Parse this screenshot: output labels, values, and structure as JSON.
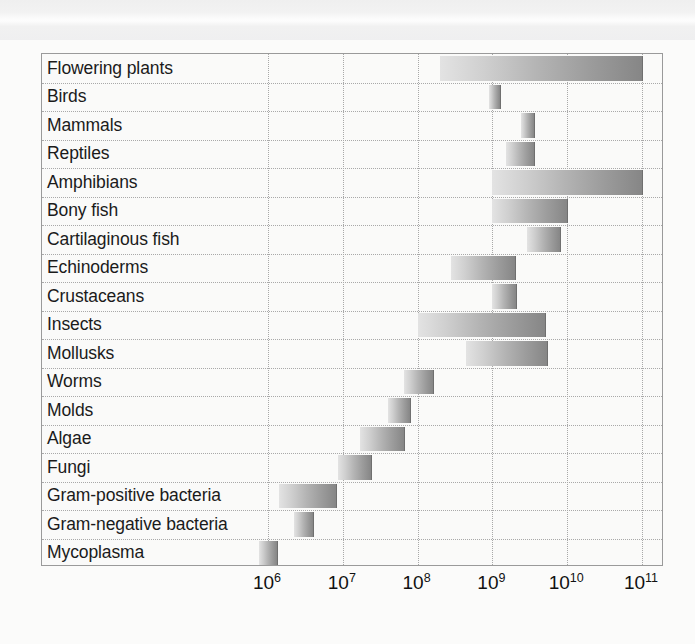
{
  "chart_data": {
    "type": "bar",
    "orientation": "horizontal",
    "title": "",
    "subtitle": "",
    "xlabel": "",
    "ylabel": "",
    "xscale": "log",
    "xlim": [
      320000.0,
      330000000000.0
    ],
    "grid": "dotted vertical and horizontal",
    "legend": "none",
    "bar_style": "horizontal range bars, grey gradient fill (light at left, dark at right)",
    "x_ticks": [
      {
        "label": "10",
        "exponent": "6",
        "value": 1000000
      },
      {
        "label": "10",
        "exponent": "7",
        "value": 10000000
      },
      {
        "label": "10",
        "exponent": "8",
        "value": 100000000
      },
      {
        "label": "10",
        "exponent": "9",
        "value": 1000000000
      },
      {
        "label": "10",
        "exponent": "10",
        "value": 10000000000
      },
      {
        "label": "10",
        "exponent": "11",
        "value": 100000000000
      }
    ],
    "categories": [
      "Flowering plants",
      "Birds",
      "Mammals",
      "Reptiles",
      "Amphibians",
      "Bony fish",
      "Cartilaginous fish",
      "Echinoderms",
      "Crustaceans",
      "Insects",
      "Mollusks",
      "Worms",
      "Molds",
      "Algae",
      "Fungi",
      "Gram-positive bacteria",
      "Gram-negative bacteria",
      "Mycoplasma"
    ],
    "ranges": [
      {
        "category": "Flowering plants",
        "low": 200000000.0,
        "high": 100000000000.0
      },
      {
        "category": "Birds",
        "low": 900000000.0,
        "high": 1250000000.0
      },
      {
        "category": "Mammals",
        "low": 2400000000.0,
        "high": 3600000000.0
      },
      {
        "category": "Reptiles",
        "low": 1500000000.0,
        "high": 3600000000.0
      },
      {
        "category": "Amphibians",
        "low": 1000000000.0,
        "high": 100000000000.0
      },
      {
        "category": "Bony fish",
        "low": 1000000000.0,
        "high": 10000000000.0
      },
      {
        "category": "Cartilaginous fish",
        "low": 2900000000.0,
        "high": 8000000000.0
      },
      {
        "category": "Echinoderms",
        "low": 280000000.0,
        "high": 2000000000.0
      },
      {
        "category": "Crustaceans",
        "low": 1000000000.0,
        "high": 2100000000.0
      },
      {
        "category": "Insects",
        "low": 100000000.0,
        "high": 5000000000.0
      },
      {
        "category": "Mollusks",
        "low": 450000000.0,
        "high": 5300000000.0
      },
      {
        "category": "Worms",
        "low": 65000000.0,
        "high": 160000000.0
      },
      {
        "category": "Molds",
        "low": 40000000.0,
        "high": 80000000.0
      },
      {
        "category": "Algae",
        "low": 17000000.0,
        "high": 65000000.0
      },
      {
        "category": "Fungi",
        "low": 8500000.0,
        "high": 24000000.0
      },
      {
        "category": "Gram-positive bacteria",
        "low": 1400000.0,
        "high": 8000000.0
      },
      {
        "category": "Gram-negative bacteria",
        "low": 2200000.0,
        "high": 4000000.0
      },
      {
        "category": "Mycoplasma",
        "low": 750000.0,
        "high": 1300000.0
      }
    ],
    "axis_geometry": {
      "x_pixel_at_1e6": 226,
      "pixels_per_decade": 74.8,
      "plot_left": 41,
      "plot_top": 53,
      "plot_width": 622,
      "plot_height": 513,
      "row_count": 18
    }
  }
}
